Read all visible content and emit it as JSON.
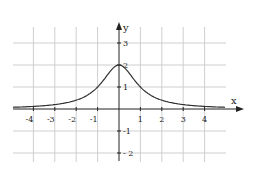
{
  "chart_data": {
    "type": "line",
    "title": "",
    "function": "f(x) = 2 / (1 + x^2)",
    "xlabel": "x",
    "ylabel": "y",
    "xlim": [
      -5,
      5
    ],
    "ylim": [
      -2.4,
      3.8
    ],
    "grid": true,
    "x_ticks": [
      -4,
      -3,
      -2,
      -1,
      1,
      2,
      3,
      4
    ],
    "y_ticks": [
      -2,
      -1,
      1,
      2,
      3
    ],
    "x_tick_labels": [
      "-4",
      "-3",
      "-2",
      "-1",
      "1",
      "2",
      "3",
      "4"
    ],
    "y_tick_labels": [
      "- 2",
      "-1",
      "1",
      "2",
      "3"
    ],
    "series": [
      {
        "name": "f(x)",
        "x": [
          -4.9,
          -4,
          -3,
          -2,
          -1.5,
          -1,
          -0.5,
          0,
          0.5,
          1,
          1.5,
          2,
          3,
          4,
          4.9
        ],
        "values": [
          0.08,
          0.12,
          0.2,
          0.4,
          0.62,
          1.0,
          1.6,
          2.0,
          1.6,
          1.0,
          0.62,
          0.4,
          0.2,
          0.12,
          0.08
        ]
      }
    ],
    "colors": {
      "axis": "#222222",
      "grid": "#cfcfcf",
      "curve": "#333333"
    }
  }
}
